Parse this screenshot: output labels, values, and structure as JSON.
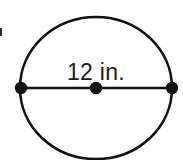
{
  "figure": {
    "kind": "geometry-diagram",
    "shape_name": "circle",
    "background_color": "#ffffff",
    "stroke_color": "#111111",
    "label_color": "#1a1a1a",
    "diameter_label": "12 in.",
    "measurement": {
      "value": "12",
      "unit": "in.",
      "quantity": "diameter"
    },
    "circle": {
      "center_x": 96,
      "center_y": 88,
      "radius_x": 76,
      "radius_y": 71,
      "stroke_width": 2.6
    },
    "diameter_segment": {
      "x1": 21,
      "y1": 88,
      "x2": 172,
      "y2": 88,
      "stroke_width": 2.4
    },
    "points": [
      {
        "name": "left-endpoint",
        "x": 21,
        "y": 88,
        "r": 6.2
      },
      {
        "name": "center-point",
        "x": 96,
        "y": 88,
        "r": 6.2
      },
      {
        "name": "right-endpoint",
        "x": 172,
        "y": 88,
        "r": 6.2
      }
    ],
    "label_position": {
      "x": 96,
      "y": 80
    },
    "artifact": {
      "x": 0,
      "y": 28,
      "width": 2,
      "height": 8,
      "color": "#2a2a2a"
    }
  }
}
